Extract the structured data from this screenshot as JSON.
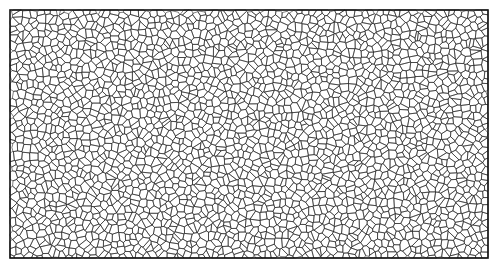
{
  "diagram": {
    "type": "voronoi-tessellation",
    "frame": {
      "x": 10,
      "y": 10,
      "width": 478,
      "height": 248
    },
    "colors": {
      "background": "#ffffff",
      "edge": "#1a1a1a",
      "frame": "#111111"
    },
    "cell_count_approx": 2600,
    "seed": 12345
  }
}
